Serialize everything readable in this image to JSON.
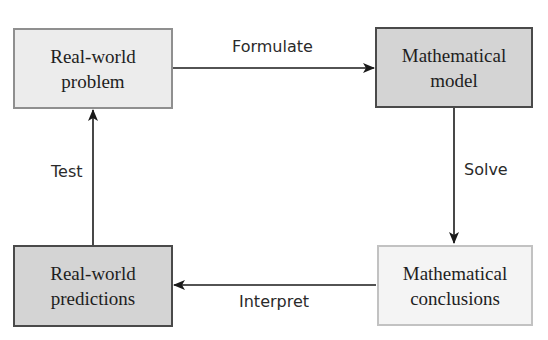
{
  "diagram": {
    "type": "cycle-flowchart",
    "nodes": [
      {
        "id": "real-world-problem",
        "line1": "Real-world",
        "line2": "problem"
      },
      {
        "id": "mathematical-model",
        "line1": "Mathematical",
        "line2": "model"
      },
      {
        "id": "mathematical-conclusions",
        "line1": "Mathematical",
        "line2": "conclusions"
      },
      {
        "id": "real-world-predictions",
        "line1": "Real-world",
        "line2": "predictions"
      }
    ],
    "edges": [
      {
        "from": "real-world-problem",
        "to": "mathematical-model",
        "label": "Formulate"
      },
      {
        "from": "mathematical-model",
        "to": "mathematical-conclusions",
        "label": "Solve"
      },
      {
        "from": "mathematical-conclusions",
        "to": "real-world-predictions",
        "label": "Interpret"
      },
      {
        "from": "real-world-predictions",
        "to": "real-world-problem",
        "label": "Test"
      }
    ]
  },
  "colors": {
    "arrow": "#1a1a1a",
    "light_box_fill": "#ececec",
    "medium_box_fill": "#d4d4d4",
    "pale_box_fill": "#f4f4f4"
  }
}
